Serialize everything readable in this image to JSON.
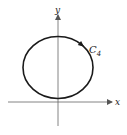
{
  "figure": {
    "axes": {
      "x_label": "x",
      "y_label": "y"
    },
    "curve": {
      "label_main": "C",
      "label_sub": "4",
      "shape": "circle",
      "orientation": "clockwise",
      "stroke_color": "#1a1a1a"
    },
    "colors": {
      "background": "#ffffff",
      "axis": "#555555",
      "curve": "#1a1a1a"
    }
  }
}
